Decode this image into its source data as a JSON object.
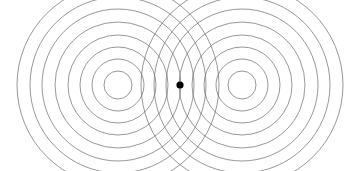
{
  "figure": {
    "background_color": "#ffffff",
    "width": 360,
    "height": 171,
    "stroke_color": "#6b6b6b",
    "stroke_width": 0.7,
    "dot_color": "#000000"
  },
  "chart_data": {
    "type": "scatter",
    "subtitle": "",
    "xlabel": "",
    "ylabel": "",
    "xlim": [
      0,
      360
    ],
    "ylim": [
      0,
      171
    ],
    "grid": false,
    "legend": null,
    "annotations": [],
    "tick_labels": {
      "x": [],
      "y": []
    },
    "series": [
      {
        "name": "left-source-circles",
        "kind": "concentric-circles",
        "center": {
          "x": 118,
          "y": 85
        },
        "radii": [
          14,
          26,
          38,
          50,
          63,
          76,
          88,
          101
        ],
        "count": 8,
        "stroke": "#6b6b6b"
      },
      {
        "name": "right-source-circles",
        "kind": "concentric-circles",
        "center": {
          "x": 242,
          "y": 85
        },
        "radii": [
          14,
          26,
          38,
          50,
          63,
          76,
          88,
          101
        ],
        "count": 8,
        "stroke": "#6b6b6b"
      },
      {
        "name": "center-point-marker",
        "kind": "point",
        "center": {
          "x": 180,
          "y": 85
        },
        "radius": 3.6,
        "fill": "#000000"
      }
    ]
  }
}
